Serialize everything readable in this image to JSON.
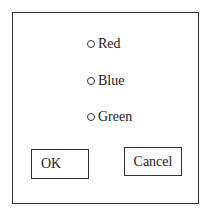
{
  "dialog": {
    "options": [
      {
        "label": "Red"
      },
      {
        "label": "Blue"
      },
      {
        "label": "Green"
      }
    ],
    "buttons": {
      "ok_label": "OK",
      "cancel_label": "Cancel"
    }
  }
}
